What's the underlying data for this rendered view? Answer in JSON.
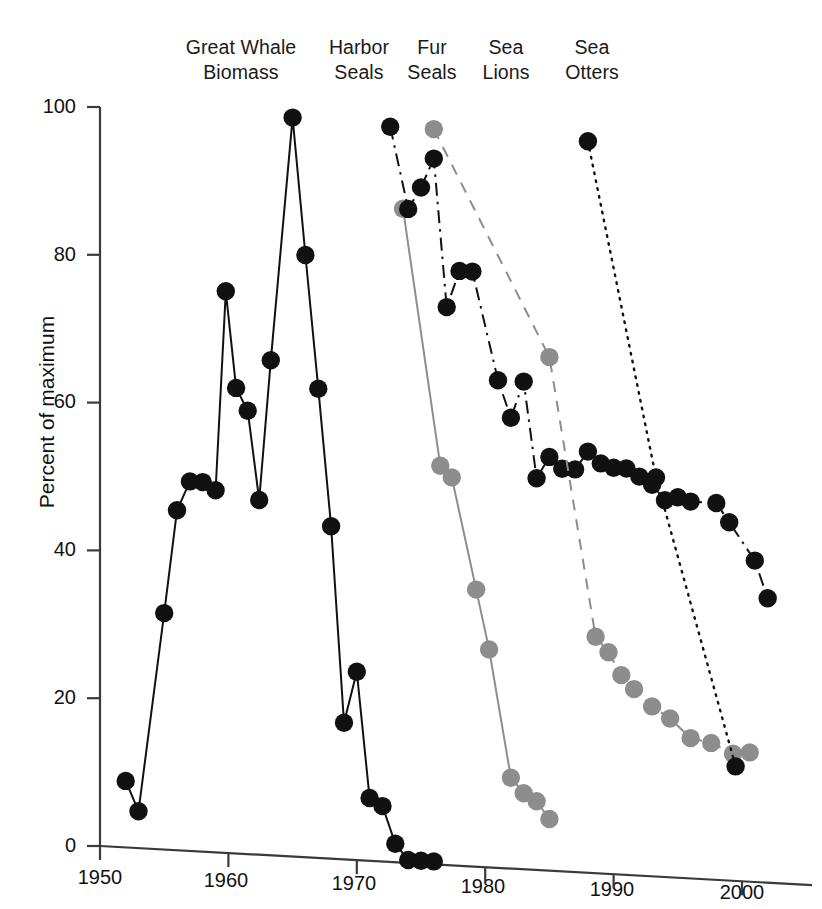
{
  "figure": {
    "ylabel": "Percent of maximum",
    "yticks": [
      "0",
      "20",
      "40",
      "60",
      "80",
      "100"
    ],
    "xticks": [
      "1950",
      "1960",
      "1970",
      "1980",
      "1990",
      "2000"
    ],
    "series_labels": [
      {
        "name": "great-whale-biomass",
        "line1": "Great Whale",
        "line2": "Biomass"
      },
      {
        "name": "harbor-seals",
        "line1": "Harbor",
        "line2": "Seals"
      },
      {
        "name": "fur-seals",
        "line1": "Fur",
        "line2": "Seals"
      },
      {
        "name": "sea-lions",
        "line1": "Sea",
        "line2": "Lions"
      },
      {
        "name": "sea-otters",
        "line1": "Sea",
        "line2": "Otters"
      }
    ]
  },
  "colors": {
    "black": "#111111",
    "gray": "#8d8d8d",
    "axis": "#3a3a3a",
    "background": "#ffffff"
  },
  "chart_data": {
    "type": "line",
    "title": "",
    "xlabel": "",
    "ylabel": "Percent of maximum",
    "xlim": [
      1950,
      2005
    ],
    "ylim": [
      0,
      100
    ],
    "grid": false,
    "legend_position": "top (inline column headings)",
    "xtick_values": [
      1950,
      1960,
      1970,
      1980,
      1990,
      2000
    ],
    "ytick_values": [
      0,
      20,
      40,
      60,
      80,
      100
    ],
    "series": [
      {
        "name": "Great Whale Biomass",
        "color": "#111111",
        "marker": "filled-circle",
        "linestyle": "solid",
        "x": [
          1952,
          1953,
          1955,
          1956,
          1957,
          1958,
          1959,
          1959.8,
          1960.6,
          1961.5,
          1962.4,
          1963.3,
          1965,
          1966,
          1967,
          1968,
          1969,
          1970,
          1971,
          1972,
          1973,
          1974,
          1975,
          1976
        ],
        "y": [
          9,
          5,
          32,
          46,
          50,
          50,
          49,
          76,
          63,
          60,
          48,
          67,
          100,
          81.5,
          63.5,
          45,
          18.5,
          25.5,
          8.5,
          7.5,
          2.5,
          0.4,
          0.4,
          0.4
        ]
      },
      {
        "name": "Harbor Seals",
        "color": "#8d8d8d",
        "marker": "filled-circle",
        "linestyle": "solid",
        "x": [
          1973.6,
          1976.5,
          1977.4,
          1979.3,
          1980.3,
          1982,
          1983,
          1984,
          1985
        ],
        "y": [
          88.5,
          54,
          52.5,
          37.5,
          29.5,
          12.3,
          10.3,
          9.3,
          7
        ]
      },
      {
        "name": "Fur Seals",
        "color": "#111111",
        "marker": "filled-circle",
        "linestyle": "dashdot",
        "x": [
          1972.6,
          1974,
          1975,
          1976,
          1977,
          1978,
          1979,
          1981,
          1982,
          1983,
          1984,
          1985,
          1986,
          1987,
          1988,
          1989,
          1990,
          1991,
          1992,
          1993,
          1994,
          1995,
          1996,
          1998,
          1999,
          2001,
          2002
        ],
        "y": [
          99.5,
          88.5,
          91.5,
          95.5,
          75.5,
          80.5,
          80.5,
          66,
          61,
          66,
          53,
          56,
          54.5,
          54.5,
          57,
          55.5,
          55,
          55,
          54,
          53,
          51,
          51.5,
          51,
          51,
          48.5,
          43.5,
          38.5
        ]
      },
      {
        "name": "Sea Lions",
        "color": "#8d8d8d",
        "marker": "filled-circle",
        "linestyle": "dashed",
        "x": [
          1976,
          1985,
          1988.6,
          1989.6,
          1990.6,
          1991.6,
          1993,
          1994.4,
          1996,
          1997.6,
          1999.3,
          2000.6
        ],
        "y": [
          99.5,
          69.5,
          32,
          30,
          27,
          25.2,
          23,
          21.5,
          19,
          18.5,
          17.2,
          17.5
        ]
      },
      {
        "name": "Sea Otters",
        "color": "#111111",
        "marker": "filled-circle",
        "linestyle": "dotted",
        "x": [
          1988,
          1993.3,
          1999.5
        ],
        "y": [
          99,
          54,
          15.5
        ]
      }
    ]
  }
}
